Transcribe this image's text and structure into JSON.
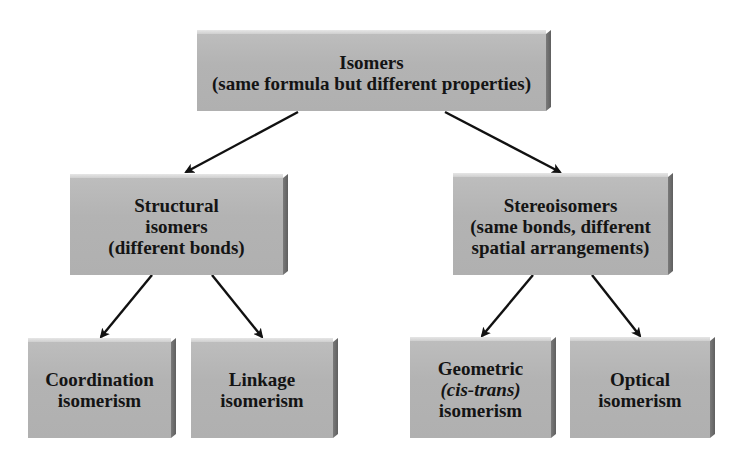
{
  "diagram": {
    "root": {
      "title": "Isomers",
      "subtitle": "(same formula but different properties)"
    },
    "structural": {
      "line1": "Structural",
      "line2": "isomers",
      "line3": "(different bonds)"
    },
    "stereo": {
      "line1": "Stereoisomers",
      "line2": "(same bonds, different",
      "line3": "spatial arrangements)"
    },
    "coordination": {
      "line1": "Coordination",
      "line2": "isomerism"
    },
    "linkage": {
      "line1": "Linkage",
      "line2": "isomerism"
    },
    "geometric": {
      "line1": "Geometric",
      "line2": "(cis-trans)",
      "line3": "isomerism"
    },
    "optical": {
      "line1": "Optical",
      "line2": "isomerism"
    },
    "edges": [
      {
        "from": "Isomers",
        "to": "Structural isomers"
      },
      {
        "from": "Isomers",
        "to": "Stereoisomers"
      },
      {
        "from": "Structural isomers",
        "to": "Coordination isomerism"
      },
      {
        "from": "Structural isomers",
        "to": "Linkage isomerism"
      },
      {
        "from": "Stereoisomers",
        "to": "Geometric (cis-trans) isomerism"
      },
      {
        "from": "Stereoisomers",
        "to": "Optical isomerism"
      }
    ],
    "colors": {
      "box_face": "#b3b3b3",
      "box_side": "#6a6a6a",
      "box_top": "#dcdcdc",
      "text": "#141414",
      "arrow": "#111111"
    }
  }
}
